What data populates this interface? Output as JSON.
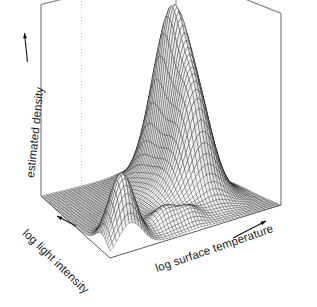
{
  "figure": {
    "kind": "persp-wireframe-3d",
    "background_color": "#ffffff",
    "mesh_color": "#000000",
    "box_color": "#8c8c8c",
    "guide_color": "#c8c8c8",
    "width": 317,
    "height": 307
  },
  "axes": {
    "x": {
      "label": "log surface temperature",
      "arrow": "arrow-right-up"
    },
    "y": {
      "label": "log light intensity",
      "arrow": "arrow-left-up"
    },
    "z": {
      "label": "estimated density",
      "arrow": "arrow-up"
    }
  },
  "chart_data": {
    "type": "surface",
    "title": "",
    "xlabel": "log surface temperature",
    "ylabel": "log light intensity",
    "zlabel": "estimated density",
    "grid": true,
    "legend": "none",
    "xlim": [
      0,
      1
    ],
    "ylim": [
      0,
      1
    ],
    "zlim": [
      0,
      1
    ],
    "nx": 54,
    "ny": 54,
    "projection": {
      "theta": -32,
      "phi": 22,
      "shade": true,
      "box": true
    },
    "components": [
      {
        "name": "main-mode",
        "cx": 0.715,
        "cy": 0.64,
        "sx": 0.072,
        "sy": 0.13,
        "amp": 1.0,
        "rot": 0.3
      },
      {
        "name": "main-shoulder",
        "cx": 0.7,
        "cy": 0.39,
        "sx": 0.085,
        "sy": 0.11,
        "amp": 0.52,
        "rot": 0.1
      },
      {
        "name": "main-skirt",
        "cx": 0.66,
        "cy": 0.52,
        "sx": 0.15,
        "sy": 0.2,
        "amp": 0.24,
        "rot": 0.0
      },
      {
        "name": "secondary-mode",
        "cx": 0.12,
        "cy": 0.12,
        "sx": 0.07,
        "sy": 0.09,
        "amp": 0.46,
        "rot": 0.0
      },
      {
        "name": "central-bump-a",
        "cx": 0.395,
        "cy": 0.15,
        "sx": 0.062,
        "sy": 0.06,
        "amp": 0.115,
        "rot": 0.0
      },
      {
        "name": "central-bump-b",
        "cx": 0.52,
        "cy": 0.105,
        "sx": 0.055,
        "sy": 0.05,
        "amp": 0.085,
        "rot": 0.0
      },
      {
        "name": "low-ridge",
        "cx": 0.3,
        "cy": 0.3,
        "sx": 0.18,
        "sy": 0.15,
        "amp": 0.045,
        "rot": 0.0
      }
    ],
    "guides": [
      {
        "name": "dotted-back-edge",
        "style": "dotted"
      },
      {
        "name": "solid-back-edge",
        "style": "solid"
      }
    ]
  }
}
